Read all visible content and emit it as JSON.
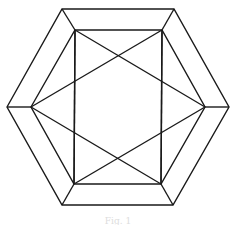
{
  "figure": {
    "stroke_color": "#1a1a1a",
    "outer_hexagon": [
      [
        7,
        107
      ],
      [
        62,
        9
      ],
      [
        174,
        9
      ],
      [
        229,
        107
      ],
      [
        173,
        205
      ],
      [
        62,
        205
      ]
    ],
    "inner_hexagon": [
      [
        31,
        107
      ],
      [
        75,
        30
      ],
      [
        162,
        30
      ],
      [
        205,
        107
      ],
      [
        161,
        184
      ],
      [
        74,
        184
      ]
    ],
    "caption": "Fig. 1"
  }
}
